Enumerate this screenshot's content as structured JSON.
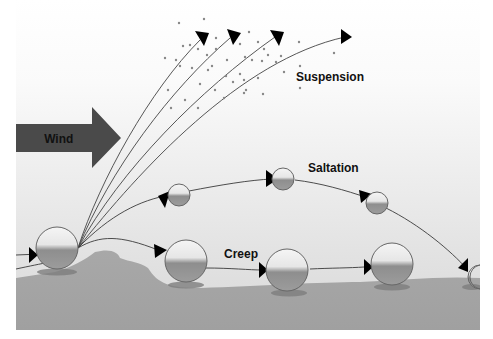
{
  "diagram": {
    "labels": {
      "wind": "Wind",
      "suspension": "Suspension",
      "saltation": "Saltation",
      "creep": "Creep"
    },
    "colors": {
      "sky_top": "#ffffff",
      "sky_bottom": "#dcdcdc",
      "ground": "#a4a4a4",
      "ground_shadow": "#8c8c8c",
      "wind_arrow": "#4a4a4a",
      "lines": "#3a3a3a",
      "arrowheads": "#000000",
      "particles": "#8a8a8a"
    },
    "transport_modes": [
      {
        "name": "Suspension",
        "description": "fine particles carried aloft along curved paths"
      },
      {
        "name": "Saltation",
        "description": "grains bounce along an arcing path"
      },
      {
        "name": "Creep",
        "description": "large grains roll along the surface"
      }
    ]
  }
}
